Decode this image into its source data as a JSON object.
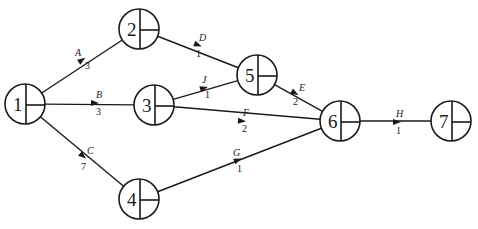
{
  "diagram": {
    "type": "activity-on-arrow network",
    "nodes": [
      {
        "id": "1",
        "label": "1",
        "cx": 25,
        "cy": 104,
        "r": 20
      },
      {
        "id": "2",
        "label": "2",
        "cx": 139,
        "cy": 29,
        "r": 20
      },
      {
        "id": "3",
        "label": "3",
        "cx": 154,
        "cy": 105,
        "r": 20
      },
      {
        "id": "4",
        "label": "4",
        "cx": 139,
        "cy": 199,
        "r": 20
      },
      {
        "id": "5",
        "label": "5",
        "cx": 257,
        "cy": 75,
        "r": 20
      },
      {
        "id": "6",
        "label": "6",
        "cx": 340,
        "cy": 121,
        "r": 20
      },
      {
        "id": "7",
        "label": "7",
        "cx": 451,
        "cy": 121,
        "r": 20
      }
    ],
    "edges": [
      {
        "activity": "A",
        "duration": "3",
        "from": "1",
        "to": "2",
        "ax": 82,
        "ay": 60,
        "lx": 75,
        "ly": 56,
        "dx": 85,
        "dy": 69
      },
      {
        "activity": "B",
        "duration": "3",
        "from": "1",
        "to": "3",
        "ax": 95,
        "ay": 103,
        "lx": 96,
        "ly": 98,
        "dx": 96,
        "dy": 115
      },
      {
        "activity": "C",
        "duration": "7",
        "from": "1",
        "to": "4",
        "ax": 83,
        "ay": 156,
        "lx": 87,
        "ly": 154,
        "dx": 81,
        "dy": 170
      },
      {
        "activity": "D",
        "duration": "1",
        "from": "2",
        "to": "5",
        "ax": 198,
        "ay": 45,
        "lx": 199,
        "ly": 41,
        "dx": 196,
        "dy": 57
      },
      {
        "activity": "J",
        "duration": "1",
        "from": "3",
        "to": "5",
        "ax": 204,
        "ay": 88,
        "lx": 202,
        "ly": 83,
        "dx": 205,
        "dy": 98
      },
      {
        "activity": "E",
        "duration": "2",
        "from": "5",
        "to": "6",
        "ax": 295,
        "ay": 93,
        "lx": 299,
        "ly": 91,
        "dx": 293,
        "dy": 105
      },
      {
        "activity": "F",
        "duration": "2",
        "from": "3",
        "to": "6",
        "ax": 242,
        "ay": 121,
        "lx": 243,
        "ly": 116,
        "dx": 242,
        "dy": 132
      },
      {
        "activity": "G",
        "duration": "1",
        "from": "4",
        "to": "6",
        "ax": 238,
        "ay": 160,
        "lx": 233,
        "ly": 156,
        "dx": 237,
        "dy": 172
      },
      {
        "activity": "H",
        "duration": "1",
        "from": "6",
        "to": "7",
        "ax": 397,
        "ay": 122,
        "lx": 396,
        "ly": 117,
        "dx": 396,
        "dy": 134
      }
    ]
  }
}
